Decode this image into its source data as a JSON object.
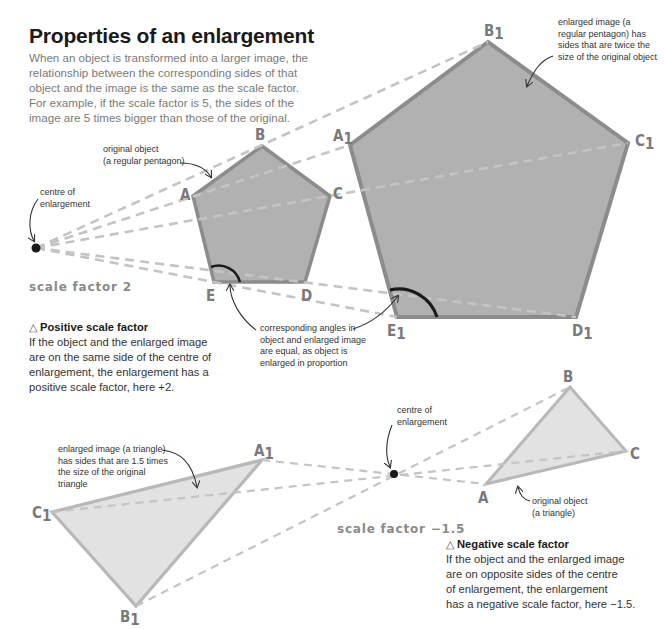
{
  "title": "Properties of an enlargement",
  "intro": "When an object is transformed into a larger image, the relationship between the corresponding sides of that object and the image is the same as the scale factor. For example, if the scale factor is 5, the sides of the image are 5 times bigger than those of the original.",
  "top_diagram": {
    "scale_factor_label": "scale factor 2",
    "centre_label_line1": "centre of",
    "centre_label_line2": "enlargement",
    "original_label_line1": "original object",
    "original_label_line2": "(a regular pentagon)",
    "enlarged_label_line1": "enlarged image (a",
    "enlarged_label_line2": "regular pentagon) has",
    "enlarged_label_line3": "sides that are twice the",
    "enlarged_label_line4": "size of the original object",
    "angles_label_line1": "corresponding angles in",
    "angles_label_line2": "object and enlarged image",
    "angles_label_line3": "are equal, as object is",
    "angles_label_line4": "enlarged in proportion",
    "vertices_original": {
      "A": "A",
      "B": "B",
      "C": "C",
      "D": "D",
      "E": "E"
    },
    "vertices_image": {
      "A": "A",
      "B": "B",
      "C": "C",
      "D": "D",
      "E": "E",
      "sub": "1"
    }
  },
  "positive_box": {
    "icon": "△",
    "heading": "Positive scale factor",
    "line1": "If the object and the enlarged image",
    "line2": "are on the same side of the centre of",
    "line3": "enlargement, the enlargement has a",
    "line4": "positive scale factor, here +2."
  },
  "bottom_diagram": {
    "scale_factor_label": "scale factor −1.5",
    "centre_label_line1": "centre of",
    "centre_label_line2": "enlargement",
    "enlarged_label_line1": "enlarged image (a triangle)",
    "enlarged_label_line2": "has sides that are 1.5 times",
    "enlarged_label_line3": "the size of the original",
    "enlarged_label_line4": "triangle",
    "original_label_line1": "original object",
    "original_label_line2": "(a triangle)",
    "vertices_original": {
      "A": "A",
      "B": "B",
      "C": "C"
    },
    "vertices_image": {
      "A": "A",
      "B": "B",
      "C": "C",
      "sub": "1"
    }
  },
  "negative_box": {
    "icon": "△",
    "heading": "Negative scale factor",
    "line1": "If the object and the enlarged image",
    "line2": "are on opposite sides of the centre",
    "line3": "of enlargement, the enlargement",
    "line4": "has a negative scale factor, here −1.5."
  },
  "colors": {
    "pentagon_fill": "#b1b1b1",
    "pentagon_stroke": "#8c8c8c",
    "triangle_fill": "#e2e2e2",
    "triangle_stroke": "#b8b8b8",
    "dash": "#c4c4c4",
    "label": "#7a7a7a"
  }
}
